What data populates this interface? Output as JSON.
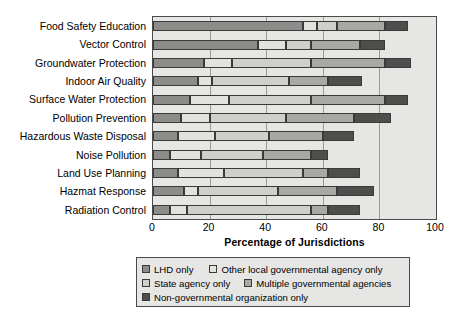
{
  "chart_data": {
    "type": "bar",
    "orientation": "horizontal",
    "stacked": true,
    "title": "",
    "xlabel": "Percentage of Jurisdictions",
    "ylabel": "",
    "xlim": [
      0,
      100
    ],
    "xticks": [
      0,
      20,
      40,
      60,
      80,
      100
    ],
    "grid": true,
    "legend_position": "bottom",
    "categories": [
      "Food Safety Education",
      "Vector Control",
      "Groundwater Protection",
      "Indoor Air Quality",
      "Surface Water Protection",
      "Pollution Prevention",
      "Hazardous Waste Disposal",
      "Noise Pollution",
      "Land Use Planning",
      "Hazmat Response",
      "Radiation Control"
    ],
    "series": [
      {
        "name": "LHD only",
        "color": "#8c8c8a",
        "values": [
          53,
          37,
          18,
          16,
          13,
          10,
          9,
          6,
          9,
          11,
          6
        ]
      },
      {
        "name": "Other local governmental agency only",
        "color": "#e2e2df",
        "values": [
          5,
          10,
          10,
          5,
          14,
          10,
          13,
          11,
          16,
          5,
          6
        ]
      },
      {
        "name": "State agency only",
        "color": "#cfcfcc",
        "values": [
          7,
          9,
          28,
          27,
          29,
          27,
          19,
          22,
          28,
          28,
          44
        ]
      },
      {
        "name": "Multiple governmental agencies",
        "color": "#a8a8a5",
        "values": [
          17,
          17,
          26,
          14,
          26,
          24,
          19,
          17,
          9,
          21,
          6
        ]
      },
      {
        "name": "Non-governmental organization only",
        "color": "#4e4e4c",
        "values": [
          8,
          9,
          9,
          12,
          8,
          13,
          11,
          6,
          11,
          13,
          11
        ]
      }
    ]
  },
  "legend": {
    "items": [
      {
        "label": "LHD only",
        "color": "#8c8c8a"
      },
      {
        "label": "Other local governmental agency only",
        "color": "#e2e2df"
      },
      {
        "label": "State agency only",
        "color": "#cfcfcc"
      },
      {
        "label": "Multiple governmental agencies",
        "color": "#a8a8a5"
      },
      {
        "label": "Non-governmental organization only",
        "color": "#4e4e4c"
      }
    ]
  },
  "axis": {
    "x_title": "Percentage of Jurisdictions",
    "x_tick_labels": [
      "0",
      "20",
      "40",
      "60",
      "80",
      "100"
    ]
  }
}
